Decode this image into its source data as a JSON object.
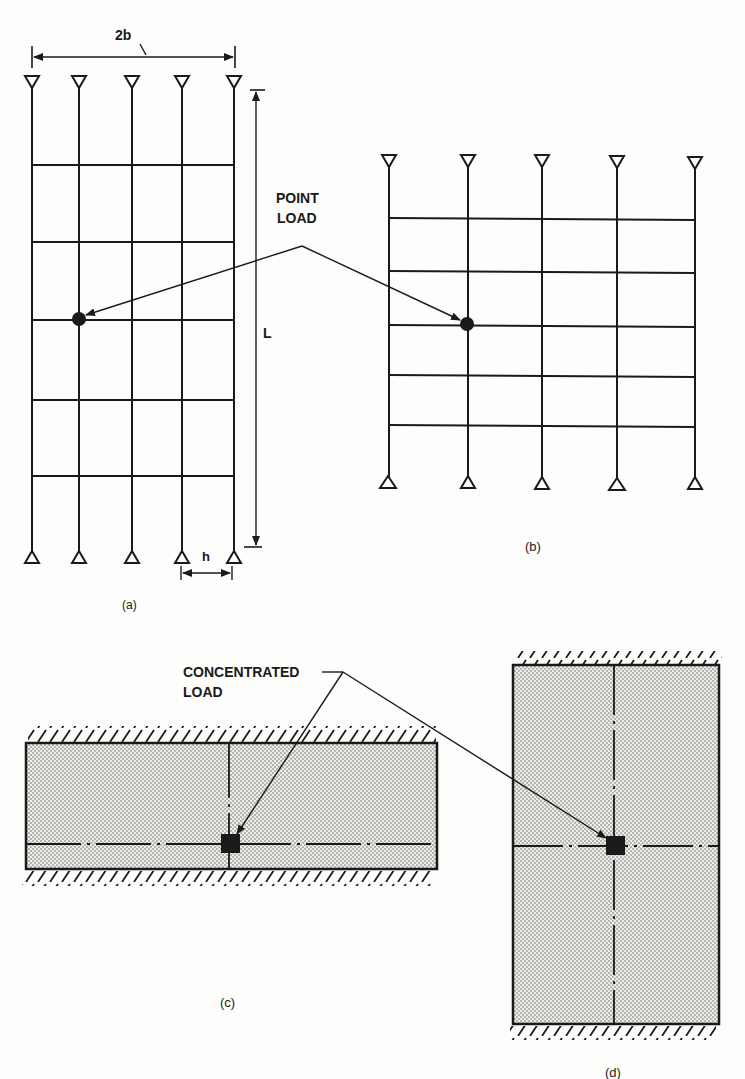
{
  "figure": {
    "panel_a": {
      "caption": "(a)",
      "dimension_width_label": "2b",
      "dimension_length_label": "L",
      "dimension_spacing_label": "h",
      "columns": 5,
      "floors": 5
    },
    "panel_b": {
      "caption": "(b)",
      "columns": 5,
      "floors": 5
    },
    "panel_c": {
      "caption": "(c)"
    },
    "panel_d": {
      "caption": "(d)"
    },
    "annotations": {
      "point_load_line1": "POINT",
      "point_load_line2": "LOAD",
      "concentrated_load_line1": "CONCENTRATED",
      "concentrated_load_line2": "LOAD"
    },
    "colors": {
      "ink": "#1a1a1a",
      "paper": "#fdfdfb",
      "plate_fill": "#d9d9d6"
    }
  }
}
